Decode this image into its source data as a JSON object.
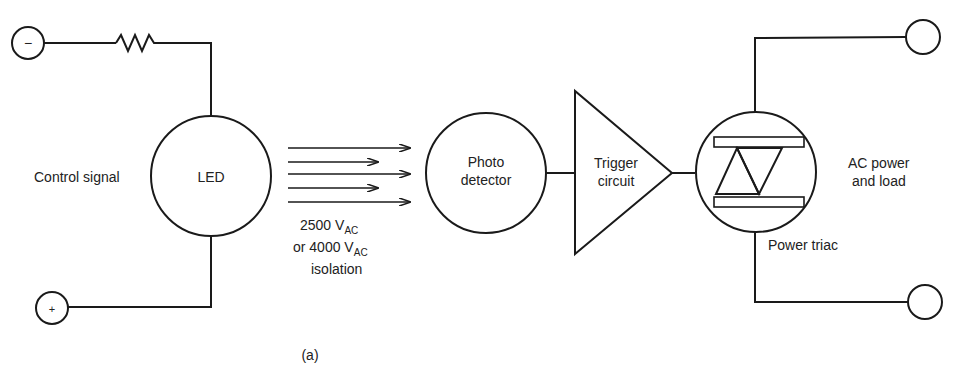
{
  "diagram": {
    "caption": "(a)",
    "terminals": {
      "minus": "−",
      "plus": "+"
    },
    "labels": {
      "control_signal": "Control signal",
      "led": "LED",
      "photo_line1": "Photo",
      "photo_line2": "detector",
      "trigger_line1": "Trigger",
      "trigger_line2": "circuit",
      "ac_line1": "AC power",
      "ac_line2": "and load",
      "power_triac": "Power triac"
    },
    "isolation": {
      "line1_value": "2500 V",
      "line1_sub": "AC",
      "line2_value": "or 4000 V",
      "line2_sub": "AC",
      "line3": "isolation"
    },
    "colors": {
      "ink": "#1a1a1a",
      "background": "#ffffff"
    }
  }
}
